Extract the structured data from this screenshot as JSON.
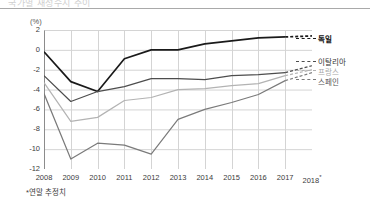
{
  "header": {
    "ghost_title": "국가별 재정수지 추이"
  },
  "axis": {
    "unit_label": "(%)",
    "y_ticks": [
      "2",
      "0",
      "-2",
      "-4",
      "-6",
      "-8",
      "-10",
      "-12"
    ],
    "x_ticks": [
      "2008",
      "2009",
      "2010",
      "2011",
      "2012",
      "2013",
      "2014",
      "2015",
      "2016",
      "2017",
      "2018"
    ],
    "x_last_marker": "*"
  },
  "footnote": "*연말 추정치",
  "legend": {
    "germany": "독일",
    "italy": "이탈리아",
    "france": "프랑스",
    "spain": "스페인"
  },
  "colors": {
    "germany": "#1a1a1a",
    "italy": "#4d4d4d",
    "france": "#b3b3b3",
    "spain": "#7a7a7a",
    "grid": "#d4d4d4",
    "axis": "#8c8c8c"
  },
  "chart_data": {
    "type": "line",
    "title": "",
    "xlabel": "",
    "ylabel": "(%)",
    "x": [
      2008,
      2009,
      2010,
      2011,
      2012,
      2013,
      2014,
      2015,
      2016,
      2017,
      2018
    ],
    "x_tick_labels": [
      "2008",
      "2009",
      "2010",
      "2011",
      "2012",
      "2013",
      "2014",
      "2015",
      "2016",
      "2017",
      "2018*"
    ],
    "ylim": [
      -12,
      2
    ],
    "y_ticks": [
      2,
      0,
      -2,
      -4,
      -6,
      -8,
      -10,
      -12
    ],
    "grid": true,
    "legend_position": "right",
    "dashed_from_index": 9,
    "annotation": "*연말 추정치",
    "series": [
      {
        "name": "독일",
        "color": "#1a1a1a",
        "values": [
          -0.2,
          -3.2,
          -4.2,
          -0.9,
          0.0,
          0.0,
          0.6,
          0.9,
          1.2,
          1.3,
          1.4
        ]
      },
      {
        "name": "이탈리아",
        "color": "#4d4d4d",
        "values": [
          -2.6,
          -5.2,
          -4.2,
          -3.7,
          -2.9,
          -2.9,
          -3.0,
          -2.6,
          -2.5,
          -2.3,
          -1.6
        ]
      },
      {
        "name": "프랑스",
        "color": "#b3b3b3",
        "values": [
          -3.3,
          -7.2,
          -6.8,
          -5.1,
          -4.8,
          -4.0,
          -3.9,
          -3.6,
          -3.4,
          -2.6,
          -2.0
        ]
      },
      {
        "name": "스페인",
        "color": "#7a7a7a",
        "values": [
          -4.4,
          -11.0,
          -9.4,
          -9.6,
          -10.5,
          -7.0,
          -6.0,
          -5.3,
          -4.5,
          -3.1,
          -2.3
        ]
      }
    ]
  }
}
